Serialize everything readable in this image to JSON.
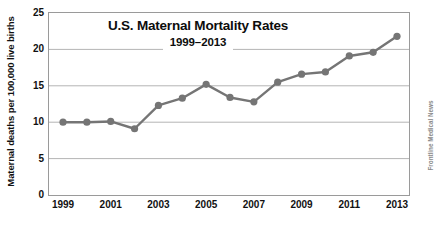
{
  "chart_data": {
    "type": "line",
    "title": "U.S. Maternal Mortality Rates",
    "subtitle": "1999–2013",
    "xlabel": "",
    "ylabel": "Maternal deaths per 100,000 live births",
    "source_credit": "Frontline Medical News",
    "x": [
      1999,
      2000,
      2001,
      2002,
      2003,
      2004,
      2005,
      2006,
      2007,
      2008,
      2009,
      2010,
      2011,
      2012,
      2013
    ],
    "values": [
      10.0,
      10.0,
      10.1,
      9.1,
      12.3,
      13.3,
      15.2,
      13.4,
      12.8,
      15.5,
      16.6,
      16.9,
      19.1,
      19.6,
      21.8
    ],
    "series": [
      {
        "name": "U.S. maternal mortality rate",
        "values": [
          10.0,
          10.0,
          10.1,
          9.1,
          12.3,
          13.3,
          15.2,
          13.4,
          12.8,
          15.5,
          16.6,
          16.9,
          19.1,
          19.6,
          21.8
        ]
      }
    ],
    "xlim": [
      1999,
      2013
    ],
    "ylim": [
      0,
      25
    ],
    "ytick_labels": [
      "0",
      "5",
      "10",
      "15",
      "20",
      "25"
    ],
    "ytick_values": [
      0,
      5,
      10,
      15,
      20,
      25
    ],
    "xtick_labels": [
      "1999",
      "2001",
      "2003",
      "2005",
      "2007",
      "2009",
      "2011",
      "2013"
    ],
    "xtick_values": [
      1999,
      2001,
      2003,
      2005,
      2007,
      2009,
      2011,
      2013
    ],
    "grid": "horizontal",
    "legend": "none",
    "line_color": "#757575",
    "marker_color": "#757575",
    "grid_color": "#b4b4b4",
    "frame_color": "#9a9a9a",
    "text_color": "#111111",
    "background": "#ffffff"
  }
}
